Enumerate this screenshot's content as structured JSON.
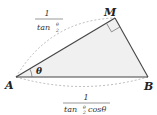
{
  "diagram": {
    "type": "right-triangle",
    "fill_color": "#f0f0f0",
    "stroke_color": "#444444",
    "dash_color": "#aaaaaa",
    "vertices": {
      "A": {
        "label": "A"
      },
      "M": {
        "label": "M"
      },
      "B": {
        "label": "B"
      }
    },
    "angle_label": "θ",
    "right_angle_at": "M",
    "side_AM": {
      "numerator": "1",
      "denominator_main": "tan",
      "denominator_frac_top": "θ",
      "denominator_frac_bottom": "2"
    },
    "side_AB": {
      "numerator": "1",
      "denominator_main": "tan",
      "denominator_frac_top": "θ",
      "denominator_frac_bottom": "2",
      "denominator_suffix": "cosθ"
    }
  }
}
